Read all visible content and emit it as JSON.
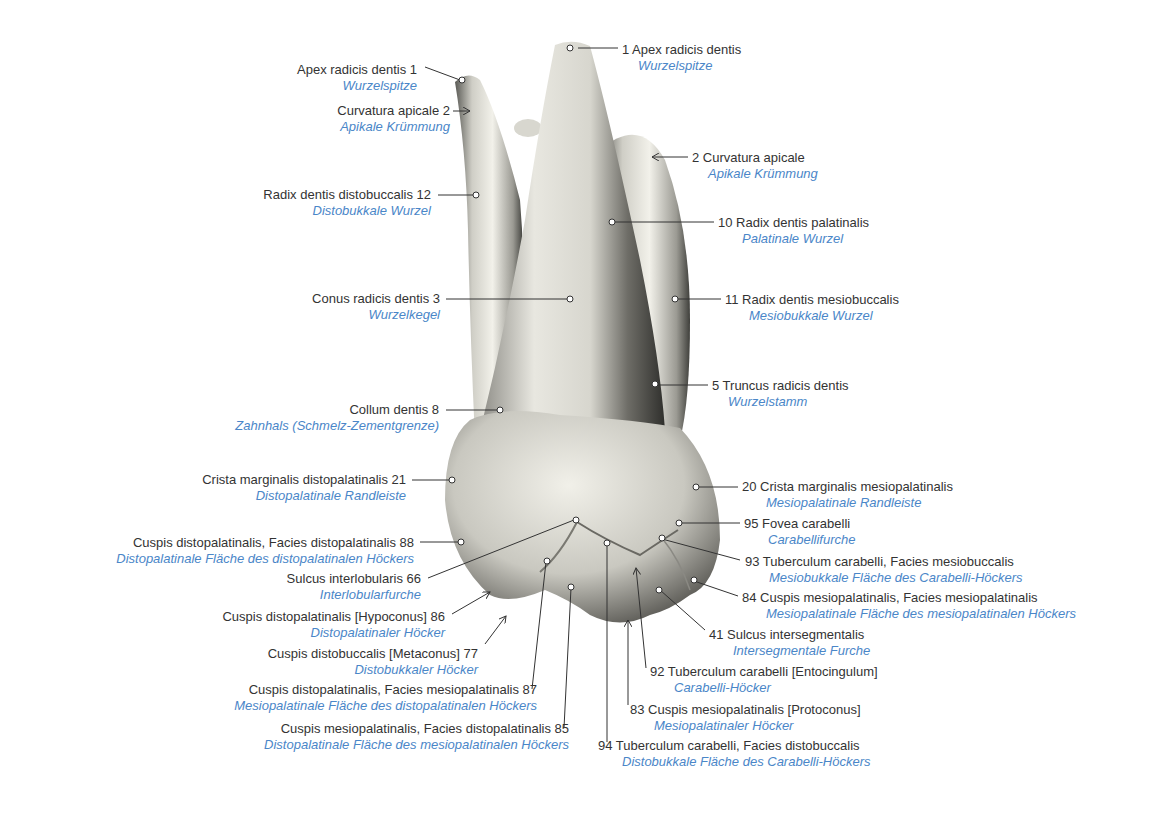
{
  "figure": {
    "colors": {
      "latin_text": "#333333",
      "german_text": "#4a86c8",
      "leader_line": "#333333",
      "tooth_light": "#ecebe4",
      "tooth_dark": "#4a4a46"
    }
  },
  "labels": [
    {
      "id": "l1a",
      "num": "1",
      "latin": "Apex radicis dentis",
      "german": "Wurzelspitze",
      "side": "left",
      "x": 417,
      "y": 62
    },
    {
      "id": "l2a",
      "num": "2",
      "latin": "Curvatura apicale",
      "german": "Apikale Krümmung",
      "side": "left",
      "x": 450,
      "y": 103
    },
    {
      "id": "l12",
      "num": "12",
      "latin": "Radix dentis distobuccalis",
      "german": "Distobukkale Wurzel",
      "side": "left",
      "x": 431,
      "y": 187
    },
    {
      "id": "l3",
      "num": "3",
      "latin": "Conus radicis dentis",
      "german": "Wurzelkegel",
      "side": "left",
      "x": 440,
      "y": 291
    },
    {
      "id": "l8",
      "num": "8",
      "latin": "Collum dentis",
      "german": "Zahnhals (Schmelz-Zementgrenze)",
      "side": "left",
      "x": 439,
      "y": 402
    },
    {
      "id": "l21",
      "num": "21",
      "latin": "Crista marginalis distopalatinalis",
      "german": "Distopalatinale Randleiste",
      "side": "left",
      "x": 406,
      "y": 472
    },
    {
      "id": "l88",
      "num": "88",
      "latin": "Cuspis distopalatinalis, Facies distopalatinalis",
      "german": "Distopalatinale Fläche des distopalatinalen Höckers",
      "side": "left",
      "x": 414,
      "y": 535
    },
    {
      "id": "l66",
      "num": "66",
      "latin": "Sulcus interlobularis",
      "german": "Interlobularfurche",
      "side": "left",
      "x": 421,
      "y": 571
    },
    {
      "id": "l86",
      "num": "86",
      "latin": "Cuspis distopalatinalis [Hypoconus]",
      "german": "Distopalatinaler Höcker",
      "side": "left",
      "x": 445,
      "y": 609
    },
    {
      "id": "l77",
      "num": "77",
      "latin": "Cuspis distobuccalis [Metaconus]",
      "german": "Distobukkaler Höcker",
      "side": "left",
      "x": 478,
      "y": 646
    },
    {
      "id": "l87",
      "num": "87",
      "latin": "Cuspis distopalatinalis, Facies mesiopalatinalis",
      "german": "Mesiopalatinale Fläche des distopalatinalen Höckers",
      "side": "left",
      "x": 537,
      "y": 682
    },
    {
      "id": "l85",
      "num": "85",
      "latin": "Cuspis mesiopalatinalis, Facies distopalatinalis",
      "german": "Distopalatinale Fläche des mesiopalatinalen Höckers",
      "side": "left",
      "x": 569,
      "y": 721
    },
    {
      "id": "l1b",
      "num": "1",
      "latin": "Apex radicis dentis",
      "german": "Wurzelspitze",
      "side": "right",
      "x": 622,
      "y": 42
    },
    {
      "id": "l2b",
      "num": "2",
      "latin": "Curvatura apicale",
      "german": "Apikale Krümmung",
      "side": "right",
      "x": 692,
      "y": 150
    },
    {
      "id": "l10",
      "num": "10",
      "latin": "Radix dentis palatinalis",
      "german": "Palatinale Wurzel",
      "side": "right",
      "x": 718,
      "y": 215
    },
    {
      "id": "l11",
      "num": "11",
      "latin": "Radix dentis mesiobuccalis",
      "german": "Mesiobukkale Wurzel",
      "side": "right",
      "x": 725,
      "y": 292
    },
    {
      "id": "l5",
      "num": "5",
      "latin": "Truncus radicis dentis",
      "german": "Wurzelstamm",
      "side": "right",
      "x": 712,
      "y": 378
    },
    {
      "id": "l20",
      "num": "20",
      "latin": "Crista marginalis mesiopalatinalis",
      "german": "Mesiopalatinale Randleiste",
      "side": "right",
      "x": 742,
      "y": 479
    },
    {
      "id": "l95",
      "num": "95",
      "latin": "Fovea carabelli",
      "german": "Carabellifurche",
      "side": "right",
      "x": 744,
      "y": 516
    },
    {
      "id": "l93",
      "num": "93",
      "latin": "Tuberculum carabelli, Facies mesiobuccalis",
      "german": "Mesiobukkale Fläche des Carabelli-Höckers",
      "side": "right",
      "x": 745,
      "y": 554
    },
    {
      "id": "l84",
      "num": "84",
      "latin": "Cuspis mesiopalatinalis, Facies mesiopalatinalis",
      "german": "Mesiopalatinale Fläche des mesiopalatinalen Höckers",
      "side": "right",
      "x": 742,
      "y": 590
    },
    {
      "id": "l41",
      "num": "41",
      "latin": "Sulcus intersegmentalis",
      "german": "Intersegmentale Furche",
      "side": "right",
      "x": 709,
      "y": 627
    },
    {
      "id": "l92",
      "num": "92",
      "latin": "Tuberculum carabelli [Entocingulum]",
      "german": "Carabelli-Höcker",
      "side": "right",
      "x": 650,
      "y": 664
    },
    {
      "id": "l83",
      "num": "83",
      "latin": "Cuspis mesiopalatinalis [Protoconus]",
      "german": "Mesiopalatinaler Höcker",
      "side": "right",
      "x": 630,
      "y": 702
    },
    {
      "id": "l94",
      "num": "94",
      "latin": "Tuberculum carabelli, Facies distobuccalis",
      "german": "Distobukkale Fläche des Carabelli-Höckers",
      "side": "right",
      "x": 598,
      "y": 738
    }
  ]
}
